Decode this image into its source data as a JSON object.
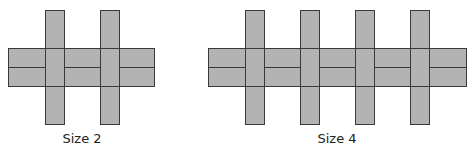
{
  "figures": [
    {
      "label": "Size 2",
      "size": 2,
      "band": {
        "x": 8,
        "y": 48,
        "w": 146,
        "h": 38,
        "mid_y": 67
      },
      "verticals": [
        {
          "x": 45,
          "w": 19
        },
        {
          "x": 100,
          "w": 19
        }
      ],
      "vertical_top": 10,
      "vertical_bottom": 124,
      "label_x": 82,
      "label_y": 131
    },
    {
      "label": "Size 4",
      "size": 4,
      "band": {
        "x": 208,
        "y": 48,
        "w": 258,
        "h": 38,
        "mid_y": 67
      },
      "verticals": [
        {
          "x": 245,
          "w": 19
        },
        {
          "x": 300,
          "w": 19
        },
        {
          "x": 355,
          "w": 19
        },
        {
          "x": 410,
          "w": 19
        }
      ],
      "vertical_top": 10,
      "vertical_bottom": 124,
      "label_x": 337,
      "label_y": 131
    }
  ],
  "colors": {
    "fill": "#b3b3b3",
    "stroke": "#3a3a3a"
  }
}
